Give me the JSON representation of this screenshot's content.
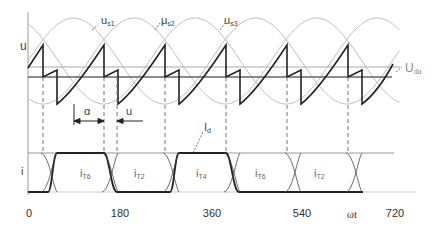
{
  "diagram": {
    "upper_plot": {
      "axis_label": "u",
      "curves": [
        {
          "id": "us1",
          "label": "u",
          "subscript": "s1"
        },
        {
          "id": "us2",
          "label": "μ",
          "subscript": "s2"
        },
        {
          "id": "us3",
          "label": "u",
          "subscript": "s3"
        }
      ],
      "mean_voltage": {
        "label": "U",
        "subscript": "dα"
      },
      "annotations": {
        "alpha": "α",
        "overlap": "u"
      }
    },
    "lower_plot": {
      "axis_label": "i",
      "dc_current": {
        "label": "I",
        "subscript": "d"
      },
      "currents": [
        {
          "label": "i",
          "subscript": "T6"
        },
        {
          "label": "i",
          "subscript": "T2"
        },
        {
          "label": "i",
          "subscript": "T4"
        },
        {
          "label": "i",
          "subscript": "T6"
        },
        {
          "label": "i",
          "subscript": "T2"
        }
      ]
    },
    "x_axis": {
      "label": "ωt",
      "ticks": [
        "0",
        "180",
        "360",
        "540",
        "720"
      ]
    },
    "colors": {
      "waveform": "#222222",
      "sine": "#b8b8b8",
      "grid": "#888888",
      "text": "#444444"
    }
  }
}
